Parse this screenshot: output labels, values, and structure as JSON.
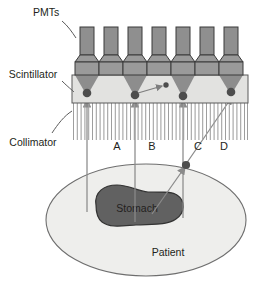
{
  "figure": {
    "type": "gamma-camera-scintigraphy-diagram",
    "labels": {
      "pmts": "PMTs",
      "scintillator": "Scintillator",
      "collimator": "Collimator",
      "stomach": "Stomach",
      "patient": "Patient"
    },
    "ray_labels": [
      "A",
      "B",
      "C",
      "D"
    ],
    "colors": {
      "pmt_body": "#9a9a9a",
      "pmt_tube": "#8f8f8f",
      "pmt_outline": "#3b3b3b",
      "scintillator_fill": "#e2e2e0",
      "light_cone": "#8d8d8d",
      "interaction_dot": "#4d4d4d",
      "collimator_septum": "#9e9e9e",
      "patient_fill": "#eeeeec",
      "patient_outline": "#6e6e6e",
      "stomach_fill": "#616161",
      "stomach_outline": "#3b3b3b",
      "ray_line": "#8a8a8a",
      "text": "#231f20",
      "leader_line": "#5a5a5a"
    },
    "pmts": {
      "count": 7,
      "x_centers": [
        87,
        111,
        135,
        159,
        183,
        207,
        231
      ]
    },
    "interaction_dots": [
      {
        "id": "A",
        "x": 87,
        "y": 93
      },
      {
        "id": "B",
        "x": 135,
        "y": 95
      },
      {
        "id": "scatter-secondary",
        "x": 166,
        "y": 88
      },
      {
        "id": "C",
        "x": 183,
        "y": 96
      },
      {
        "id": "D",
        "x": 231,
        "y": 92
      }
    ],
    "scatter_point_in_patient": {
      "x": 186,
      "y": 165
    },
    "rays": [
      {
        "id": "A",
        "kind": "vertical",
        "x": 87
      },
      {
        "id": "B",
        "kind": "vertical",
        "x": 135
      },
      {
        "id": "C",
        "kind": "vertical",
        "x": 183
      },
      {
        "id": "D",
        "kind": "oblique-scattered",
        "from": [
          186,
          165
        ],
        "to": [
          231,
          92
        ]
      }
    ]
  }
}
